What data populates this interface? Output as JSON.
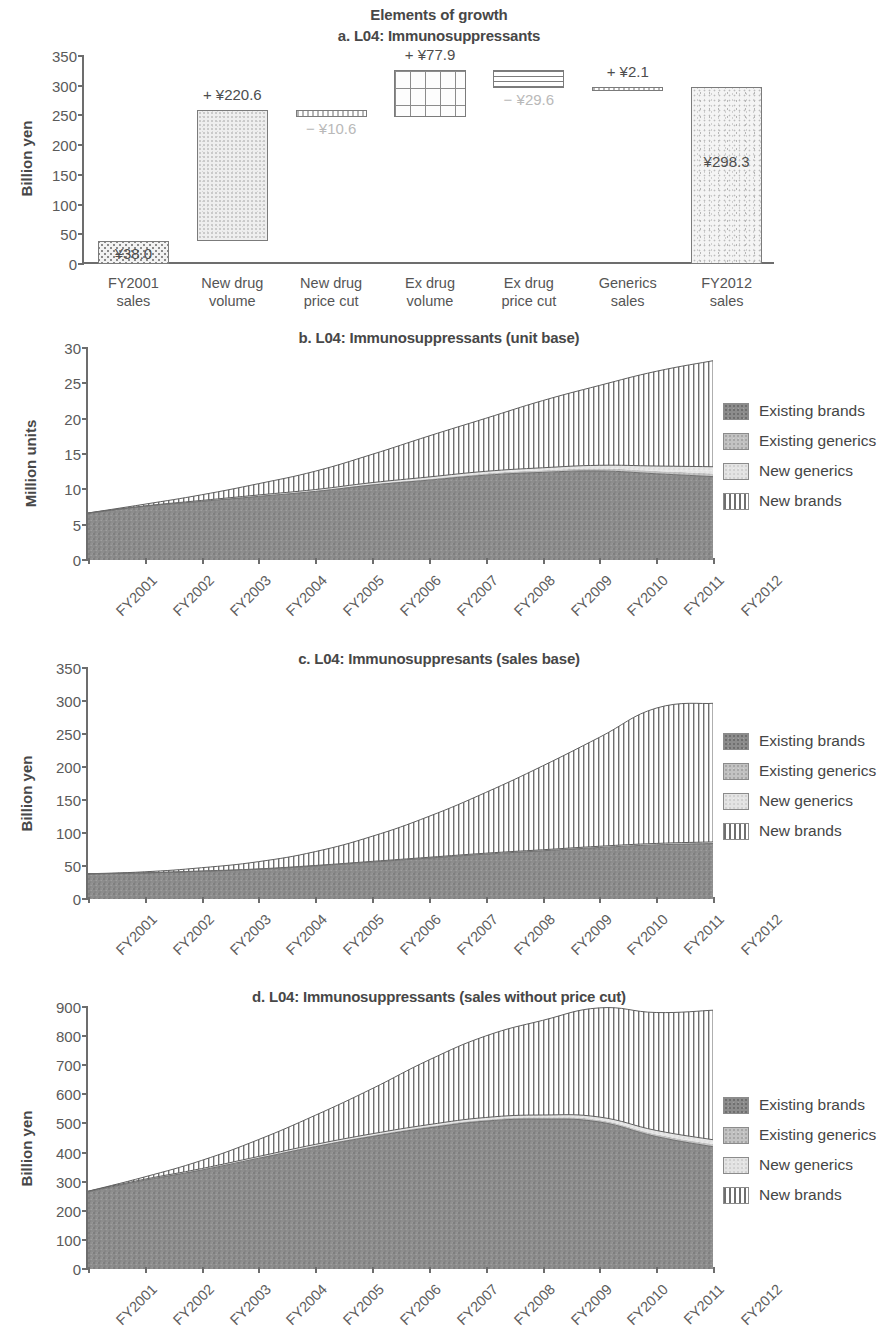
{
  "figure": {
    "title": "Elements of growth"
  },
  "panels": {
    "a": {
      "title": "a. L04: Immunosuppressants",
      "ylabel": "Billion yen"
    },
    "b": {
      "title": "b. L04: Immunosuppressants (unit base)",
      "ylabel": "Million units"
    },
    "c": {
      "title": "c. L04: Immunosuppresants (sales base)",
      "ylabel": "Billion yen"
    },
    "d": {
      "title": "d. L04: Immunosuppressants (sales without price cut)",
      "ylabel": "Billion yen"
    }
  },
  "legend": {
    "items": [
      {
        "label": "Existing brands",
        "swatch": "exbrand",
        "color": "#8c8c8c"
      },
      {
        "label": "Existing generics",
        "swatch": "exgen",
        "color": "#c2c2c2"
      },
      {
        "label": "New generics",
        "swatch": "newgen",
        "color": "#e4e4e4"
      },
      {
        "label": "New brands",
        "swatch": "newbrand",
        "color": "#ffffff"
      }
    ]
  },
  "chart_data": [
    {
      "type": "bar",
      "id": "panel-a-waterfall",
      "title": "a. L04: Immunosuppressants",
      "subtitle": "Elements of growth",
      "xlabel": "",
      "ylabel": "Billion yen",
      "ylim": [
        0,
        350
      ],
      "yticks": [
        0,
        50,
        100,
        150,
        200,
        250,
        300,
        350
      ],
      "grid": false,
      "categories": [
        "FY2001 sales",
        "New drug volume",
        "New drug price cut",
        "Ex drug volume",
        "Ex drug price cut",
        "Generics sales",
        "FY2012 sales"
      ],
      "category_lines": [
        [
          "FY2001",
          "sales"
        ],
        [
          "New drug",
          "volume"
        ],
        [
          "New drug",
          "price cut"
        ],
        [
          "Ex drug",
          "volume"
        ],
        [
          "Ex drug",
          "price cut"
        ],
        [
          "Generics",
          "sales"
        ],
        [
          "FY2012",
          "sales"
        ]
      ],
      "bars": [
        {
          "name": "FY2001 sales",
          "kind": "total",
          "base": 0.0,
          "top": 38.0,
          "delta": 38.0,
          "label": "¥38.0",
          "label_pos": "inside",
          "pattern": "dots"
        },
        {
          "name": "New drug volume",
          "kind": "increase",
          "base": 38.0,
          "top": 258.6,
          "delta": 220.6,
          "label": "+ ¥220.6",
          "label_pos": "above",
          "pattern": "speckle"
        },
        {
          "name": "New drug price cut",
          "kind": "decrease",
          "base": 248.0,
          "top": 258.6,
          "delta": -10.6,
          "label": "− ¥10.6",
          "label_pos": "below",
          "pattern": "tinyline"
        },
        {
          "name": "Ex drug volume",
          "kind": "increase",
          "base": 248.0,
          "top": 325.9,
          "delta": 77.9,
          "label": "+ ¥77.9",
          "label_pos": "above",
          "pattern": "grid"
        },
        {
          "name": "Ex drug price cut",
          "kind": "decrease",
          "base": 296.3,
          "top": 325.9,
          "delta": -29.6,
          "label": "− ¥29.6",
          "label_pos": "below",
          "pattern": "hline"
        },
        {
          "name": "Generics sales",
          "kind": "increase",
          "base": 296.2,
          "top": 298.3,
          "delta": 2.1,
          "label": "+ ¥2.1",
          "label_pos": "above",
          "pattern": "tinyline"
        },
        {
          "name": "FY2012 sales",
          "kind": "total",
          "base": 0.0,
          "top": 298.3,
          "delta": 298.3,
          "label": "¥298.3",
          "label_pos": "inside",
          "pattern": "noise"
        }
      ]
    },
    {
      "type": "area",
      "id": "panel-b-units",
      "title": "b. L04: Immunosuppressants (unit base)",
      "xlabel": "",
      "ylabel": "Million units",
      "ylim": [
        0,
        30
      ],
      "yticks": [
        0,
        5,
        10,
        15,
        20,
        25,
        30
      ],
      "grid": false,
      "stacked": true,
      "legend_position": "right",
      "x": [
        "FY2001",
        "FY2002",
        "FY2003",
        "FY2004",
        "FY2005",
        "FY2006",
        "FY2007",
        "FY2008",
        "FY2009",
        "FY2010",
        "FY2011",
        "FY2012"
      ],
      "series": [
        {
          "name": "Existing brands",
          "values": [
            6.6,
            7.6,
            8.3,
            9.0,
            9.7,
            10.6,
            11.3,
            12.0,
            12.4,
            12.6,
            12.2,
            11.8
          ]
        },
        {
          "name": "Existing generics",
          "values": [
            0.05,
            0.05,
            0.08,
            0.1,
            0.12,
            0.15,
            0.2,
            0.25,
            0.3,
            0.35,
            0.4,
            0.45
          ]
        },
        {
          "name": "New generics",
          "values": [
            0.0,
            0.0,
            0.05,
            0.1,
            0.15,
            0.2,
            0.25,
            0.3,
            0.35,
            0.45,
            0.7,
            0.95
          ]
        },
        {
          "name": "New brands",
          "values": [
            0.0,
            0.25,
            0.8,
            1.6,
            2.6,
            4.0,
            5.8,
            7.5,
            9.5,
            11.3,
            13.4,
            15.0
          ]
        }
      ],
      "totals": [
        6.65,
        7.9,
        9.23,
        10.8,
        12.57,
        14.95,
        17.55,
        20.05,
        22.55,
        24.7,
        26.7,
        28.2
      ]
    },
    {
      "type": "area",
      "id": "panel-c-sales",
      "title": "c. L04: Immunosuppresants (sales base)",
      "xlabel": "",
      "ylabel": "Billion yen",
      "ylim": [
        0,
        350
      ],
      "yticks": [
        0,
        50,
        100,
        150,
        200,
        250,
        300,
        350
      ],
      "grid": false,
      "stacked": true,
      "legend_position": "right",
      "x": [
        "FY2001",
        "FY2002",
        "FY2003",
        "FY2004",
        "FY2005",
        "FY2006",
        "FY2007",
        "FY2008",
        "FY2009",
        "FY2010",
        "FY2011",
        "FY2012"
      ],
      "series": [
        {
          "name": "Existing brands",
          "values": [
            38.0,
            39.5,
            42.0,
            45.0,
            50.0,
            56.0,
            62.0,
            68.0,
            73.0,
            78.0,
            82.0,
            84.0
          ]
        },
        {
          "name": "Existing generics",
          "values": [
            0.2,
            0.2,
            0.3,
            0.4,
            0.5,
            0.6,
            0.7,
            0.8,
            0.9,
            1.0,
            1.1,
            1.2
          ]
        },
        {
          "name": "New generics",
          "values": [
            0.0,
            0.0,
            0.1,
            0.2,
            0.3,
            0.4,
            0.5,
            0.6,
            0.7,
            0.9,
            1.1,
            1.3
          ]
        },
        {
          "name": "New brands",
          "values": [
            0.0,
            1.5,
            5.0,
            11.0,
            21.0,
            38.0,
            62.0,
            92.0,
            127.0,
            165.0,
            205.0,
            210.0
          ]
        }
      ],
      "totals": [
        38.2,
        41.2,
        47.4,
        56.6,
        71.8,
        95.0,
        125.2,
        161.4,
        201.6,
        244.9,
        289.2,
        296.5
      ]
    },
    {
      "type": "area",
      "id": "panel-d-nopricecut",
      "title": "d. L04: Immunosuppressants (sales without price cut)",
      "xlabel": "",
      "ylabel": "Billion yen",
      "ylim": [
        0,
        900
      ],
      "yticks": [
        0,
        100,
        200,
        300,
        400,
        500,
        600,
        700,
        800,
        900
      ],
      "grid": false,
      "stacked": true,
      "legend_position": "right",
      "x": [
        "FY2001",
        "FY2002",
        "FY2003",
        "FY2004",
        "FY2005",
        "FY2006",
        "FY2007",
        "FY2008",
        "FY2009",
        "FY2010",
        "FY2011",
        "FY2012"
      ],
      "series": [
        {
          "name": "Existing brands",
          "values": [
            265.0,
            305.0,
            340.0,
            380.0,
            420.0,
            455.0,
            485.0,
            508.0,
            515.0,
            505.0,
            455.0,
            420.0
          ]
        },
        {
          "name": "Existing generics",
          "values": [
            2.0,
            2.5,
            3.0,
            3.5,
            4.0,
            4.5,
            5.0,
            5.5,
            6.0,
            7.0,
            8.0,
            9.0
          ]
        },
        {
          "name": "New generics",
          "values": [
            0.0,
            1.0,
            2.0,
            3.0,
            4.0,
            5.0,
            6.0,
            7.0,
            8.0,
            10.0,
            13.0,
            15.0
          ]
        },
        {
          "name": "New brands",
          "values": [
            0.0,
            8.0,
            28.0,
            58.0,
            100.0,
            155.0,
            222.0,
            280.0,
            325.0,
            375.0,
            405.0,
            445.0
          ]
        }
      ],
      "totals": [
        267.0,
        316.5,
        373.0,
        444.5,
        528.0,
        619.5,
        718.0,
        800.5,
        854.0,
        897.0,
        881.0,
        889.0
      ]
    }
  ]
}
